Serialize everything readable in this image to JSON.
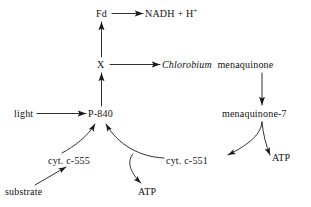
{
  "diagram": {
    "type": "pathway-flow-diagram",
    "background_color": "#ffffff",
    "line_color": "#1a1a1a",
    "text_color": "#111111",
    "nodes": [
      {
        "id": "fd",
        "label": "Fd",
        "x": 96,
        "y": 8
      },
      {
        "id": "nadh",
        "label": "NADH  +  H",
        "sup": "+",
        "x": 145,
        "y": 8
      },
      {
        "id": "x",
        "label": "X",
        "x": 97,
        "y": 59
      },
      {
        "id": "chloro",
        "label_italic": "Chlorobium",
        "label_roman": "menaquinone",
        "x": 162,
        "y": 59
      },
      {
        "id": "light",
        "label": "light",
        "x": 14,
        "y": 108
      },
      {
        "id": "p840",
        "label": "P-840",
        "x": 88,
        "y": 108
      },
      {
        "id": "mq7",
        "label": "menaquinone-7",
        "x": 222,
        "y": 108
      },
      {
        "id": "c555",
        "label": "cyt. c-555",
        "x": 48,
        "y": 155
      },
      {
        "id": "c551",
        "label": "cyt. c-551",
        "x": 166,
        "y": 155
      },
      {
        "id": "atp_right",
        "label": "ATP",
        "x": 272,
        "y": 152
      },
      {
        "id": "substrate",
        "label": "substrate",
        "x": 5,
        "y": 186
      },
      {
        "id": "atp_mid",
        "label": "ATP",
        "x": 138,
        "y": 186
      }
    ],
    "edges": [
      {
        "id": "fd-to-nadh",
        "from": "fd",
        "to": "nadh",
        "style": "straight-horizontal",
        "direction": "right"
      },
      {
        "id": "x-to-fd",
        "from": "x",
        "to": "fd",
        "style": "straight-vertical",
        "direction": "up"
      },
      {
        "id": "x-to-chlorobium",
        "from": "x",
        "to": "chloro",
        "style": "straight-horizontal",
        "direction": "right"
      },
      {
        "id": "p840-to-x",
        "from": "p840",
        "to": "x",
        "style": "straight-vertical",
        "direction": "up"
      },
      {
        "id": "light-to-p840",
        "from": "light",
        "to": "p840",
        "style": "straight-horizontal",
        "direction": "right"
      },
      {
        "id": "chlorobium-to-mq7",
        "from": "chloro",
        "to": "mq7",
        "style": "straight-vertical",
        "direction": "down"
      },
      {
        "id": "mq7-to-c551",
        "from": "mq7",
        "to": "c551",
        "style": "curved-fork-left",
        "direction": "down-left"
      },
      {
        "id": "mq7-to-atp",
        "from": "mq7",
        "to": "atp_right",
        "style": "curved-fork-right",
        "direction": "down-right"
      },
      {
        "id": "c551-to-p840",
        "from": "c551",
        "to": "p840",
        "style": "curved",
        "direction": "up-left"
      },
      {
        "id": "c551-branch-atp",
        "from": "c551",
        "to": "atp_mid",
        "style": "curved-branch",
        "direction": "down"
      },
      {
        "id": "c555-to-p840",
        "from": "c555",
        "to": "p840",
        "style": "curved",
        "direction": "up-right"
      },
      {
        "id": "substrate-to-c555",
        "from": "substrate",
        "to": "c555",
        "style": "straight-diagonal",
        "direction": "up-right"
      }
    ]
  }
}
